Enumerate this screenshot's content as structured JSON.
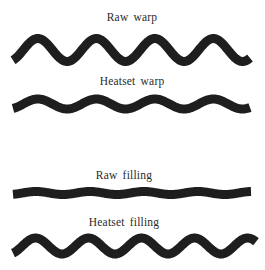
{
  "figure": {
    "ink_color": "#1e1e1e",
    "label_color": "#2a2a2a",
    "background": "#ffffff"
  },
  "yarns": [
    {
      "label": "Raw warp",
      "label_x": 132,
      "label_y": 21,
      "x_start": 13,
      "x_end": 250,
      "center_y": 50,
      "amplitude": 11.5,
      "period": 58.5,
      "phase_start": "trough-rising",
      "stroke_width": 9
    },
    {
      "label": "Heatset warp",
      "label_x": 132,
      "label_y": 85,
      "x_start": 13,
      "x_end": 250,
      "center_y": 104,
      "amplitude": 5,
      "period": 58.5,
      "phase_start": "trough-rising",
      "stroke_width": 9
    },
    {
      "label": "Raw filling",
      "label_x": 124,
      "label_y": 179,
      "x_start": 13,
      "x_end": 251,
      "center_y": 193,
      "amplitude": 1.5,
      "period": 54,
      "phase_start": "trough-rising",
      "stroke_width": 9
    },
    {
      "label": "Heatset filling",
      "label_x": 124,
      "label_y": 226,
      "x_start": 13,
      "x_end": 256,
      "center_y": 246,
      "amplitude": 8,
      "period": 53,
      "phase_start": "trough-rising",
      "stroke_width": 9
    }
  ]
}
